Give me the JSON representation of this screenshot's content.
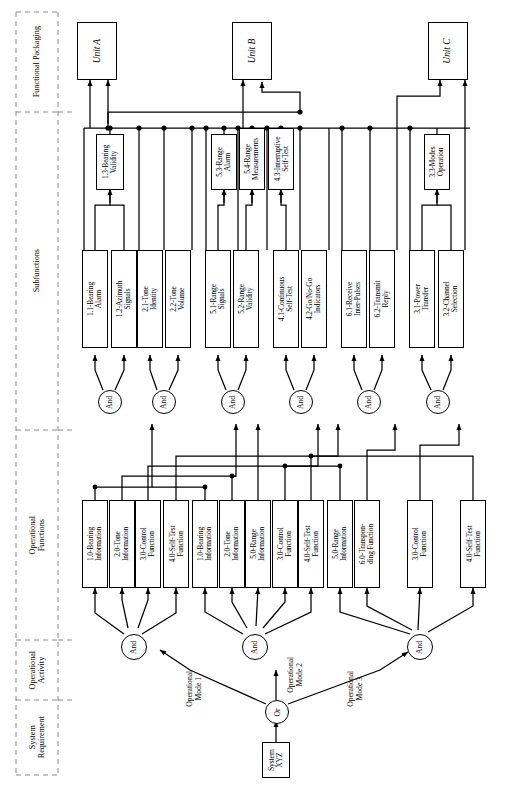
{
  "diagram": {
    "orientation": "rotated-90",
    "zones": [
      {
        "id": "system-requirement",
        "label": "System\nRequirement"
      },
      {
        "id": "operational-activity",
        "label": "Operational\nActivity"
      },
      {
        "id": "operational-functions",
        "label": "Operational\nFunctions"
      },
      {
        "id": "subfunctions",
        "label": "Subfunctions"
      },
      {
        "id": "functional-packaging",
        "label": "Functional Packaging"
      }
    ]
  },
  "system_requirement": {
    "label": "System\nXYZ"
  },
  "or_gate": {
    "label": "Or"
  },
  "and_label": "And",
  "mode_edges": [
    {
      "id": "mode-1",
      "label": "Operational\nMode 1"
    },
    {
      "id": "mode-2",
      "label": "Operational\nMode 2"
    },
    {
      "id": "mode-3",
      "label": "Operational\nMode 3"
    }
  ],
  "activity_gates": [
    {
      "id": "activity-and-1",
      "label": "And"
    },
    {
      "id": "activity-and-2",
      "label": "And"
    },
    {
      "id": "activity-and-3",
      "label": "And"
    }
  ],
  "operational_functions": [
    {
      "id": "of-1",
      "label": "1.0-Bearing\nInformation"
    },
    {
      "id": "of-2",
      "label": "2.0-Tone\nInformation"
    },
    {
      "id": "of-3",
      "label": "3.0-Control\nFunction"
    },
    {
      "id": "of-4",
      "label": "4.0-Self-Test\nFunction"
    },
    {
      "id": "of-5",
      "label": "1.0-Bearing\nInformation"
    },
    {
      "id": "of-6",
      "label": "2.0-Tone\nInformation"
    },
    {
      "id": "of-7",
      "label": "5.0-Range\nInformation"
    },
    {
      "id": "of-8",
      "label": "3.0-Control\nFunction"
    },
    {
      "id": "of-9",
      "label": "4.0-Self-Test\nFunction"
    },
    {
      "id": "of-10",
      "label": "5.0-Range\nInformation"
    },
    {
      "id": "of-11",
      "label": "6.0-Transpon-\nding Function"
    },
    {
      "id": "of-12",
      "label": "3.0-Control\nFunction"
    },
    {
      "id": "of-13",
      "label": "4.0-Self-Test\nFunction"
    }
  ],
  "subfunction_gates": [
    {
      "id": "sub-and-1",
      "label": "And"
    },
    {
      "id": "sub-and-2",
      "label": "And"
    },
    {
      "id": "sub-and-3",
      "label": "And"
    },
    {
      "id": "sub-and-4",
      "label": "And"
    },
    {
      "id": "sub-and-5",
      "label": "And"
    },
    {
      "id": "sub-and-6",
      "label": "And"
    }
  ],
  "subfunctions": [
    {
      "id": "sf-1",
      "label": "1.1-Bearing\nAlarm"
    },
    {
      "id": "sf-2",
      "label": "1.2-Azimuth\nSignals"
    },
    {
      "id": "sf-3",
      "label": "2.1-Tone\nIdentity"
    },
    {
      "id": "sf-4",
      "label": "2.2-Tone\nVolume"
    },
    {
      "id": "sf-5",
      "label": "5.1-Range\nSignals"
    },
    {
      "id": "sf-6",
      "label": "5.2-Range\nValidity"
    },
    {
      "id": "sf-7",
      "label": "4.1-Continuous\nSelf-Test"
    },
    {
      "id": "sf-8",
      "label": "4.2-Go/No-Go\nIndicators"
    },
    {
      "id": "sf-9",
      "label": "6.1-Receive\nInter-Pulses"
    },
    {
      "id": "sf-10",
      "label": "6.2-Transmit\nReply"
    },
    {
      "id": "sf-11",
      "label": "3.1-Power\nTransfer"
    },
    {
      "id": "sf-12",
      "label": "3.2-Channel\nSelection"
    }
  ],
  "derived_subfunctions": [
    {
      "id": "dsf-1",
      "label": "1.3-Bearing\nValidity"
    },
    {
      "id": "dsf-2",
      "label": "5.3-Range\nAlarm"
    },
    {
      "id": "dsf-3",
      "label": "5.4-Range\nMeasurements"
    },
    {
      "id": "dsf-4",
      "label": "4.3-Interruptive\nSelf-Test"
    },
    {
      "id": "dsf-5",
      "label": "3.3-Modes\nOperation"
    }
  ],
  "units": [
    {
      "id": "unit-a",
      "label": "Unit A"
    },
    {
      "id": "unit-b",
      "label": "Unit B"
    },
    {
      "id": "unit-c",
      "label": "Unit C"
    }
  ],
  "colors": {
    "line": "#000000",
    "box_fill": "#ffffff",
    "divider": "#888888"
  }
}
